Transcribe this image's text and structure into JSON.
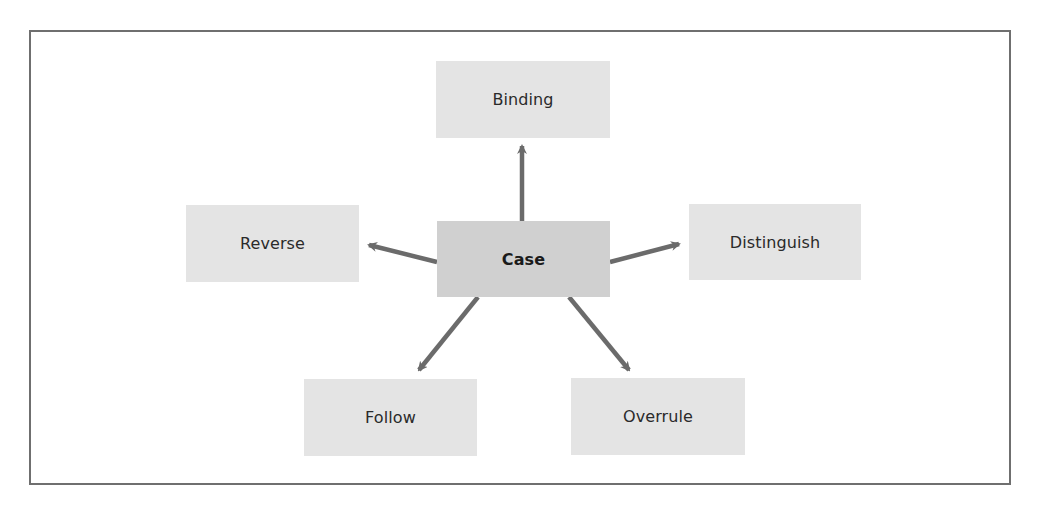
{
  "diagram": {
    "center": {
      "label": "Case"
    },
    "nodes": [
      {
        "id": "binding",
        "label": "Binding"
      },
      {
        "id": "reverse",
        "label": "Reverse"
      },
      {
        "id": "distinguish",
        "label": "Distinguish"
      },
      {
        "id": "follow",
        "label": "Follow"
      },
      {
        "id": "overrule",
        "label": "Overrule"
      }
    ],
    "edges": [
      {
        "from": "Case",
        "to": "Binding"
      },
      {
        "from": "Case",
        "to": "Reverse"
      },
      {
        "from": "Case",
        "to": "Distinguish"
      },
      {
        "from": "Case",
        "to": "Follow"
      },
      {
        "from": "Case",
        "to": "Overrule"
      }
    ],
    "colors": {
      "frame": "#6f6f6f",
      "node_fill": "#e4e4e4",
      "center_fill": "#d0d0d0",
      "arrow": "#6b6b6b",
      "text": "#2a2a2a"
    }
  }
}
